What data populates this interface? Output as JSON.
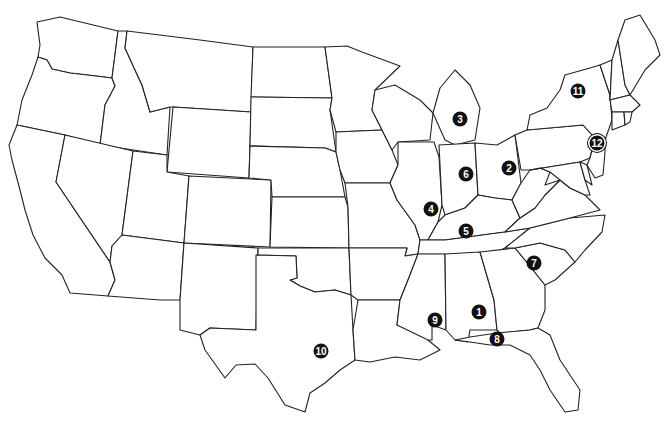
{
  "map": {
    "title": "United States (contiguous) outline map with numbered locations",
    "markers": [
      {
        "label": "1",
        "state": "Alabama",
        "x": 479,
        "y": 312
      },
      {
        "label": "2",
        "state": "Ohio",
        "x": 509,
        "y": 168
      },
      {
        "label": "3",
        "state": "Michigan",
        "x": 460,
        "y": 119
      },
      {
        "label": "4",
        "state": "Illinois",
        "x": 431,
        "y": 209
      },
      {
        "label": "5",
        "state": "Kentucky",
        "x": 466,
        "y": 231
      },
      {
        "label": "6",
        "state": "Indiana",
        "x": 466,
        "y": 174
      },
      {
        "label": "7",
        "state": "South Carolina",
        "x": 534,
        "y": 263
      },
      {
        "label": "8",
        "state": "Florida panhandle",
        "x": 497,
        "y": 339
      },
      {
        "label": "9",
        "state": "Mississippi",
        "x": 435,
        "y": 320
      },
      {
        "label": "10",
        "state": "Texas",
        "x": 321,
        "y": 351
      },
      {
        "label": "11",
        "state": "New York",
        "x": 578,
        "y": 91
      },
      {
        "label": "12",
        "state": "New Jersey / New York City",
        "x": 597,
        "y": 143
      }
    ],
    "colors": {
      "outline": "#222222",
      "fill": "#ffffff",
      "marker": "#111111",
      "marker_text": "#ffffff"
    }
  }
}
